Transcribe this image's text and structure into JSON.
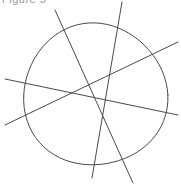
{
  "caption": {
    "text": "Figure 5"
  },
  "figure": {
    "stroke_color": "#4a4a4a",
    "stroke_width": 1,
    "circle": {
      "cx": 95,
      "cy": 95,
      "rx": 71,
      "ry": 72
    },
    "lines": [
      {
        "id": "line-a",
        "x1": 55,
        "y1": 10,
        "x2": 133,
        "y2": 183
      },
      {
        "id": "line-b",
        "x1": 122,
        "y1": 2,
        "x2": 92,
        "y2": 178
      },
      {
        "id": "line-c",
        "x1": 178,
        "y1": 42,
        "x2": 5,
        "y2": 125
      },
      {
        "id": "line-d",
        "x1": 5,
        "y1": 79,
        "x2": 178,
        "y2": 115
      }
    ]
  }
}
